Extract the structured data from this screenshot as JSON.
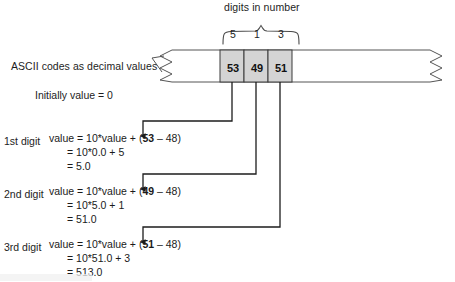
{
  "diagram": {
    "title_caption": "digits in number",
    "tape_label": "ASCII codes as decimal values",
    "initial_label": "Initially value = 0",
    "accent_color": "#d4d4d4",
    "line_color": "#222222",
    "digits": [
      "5",
      "1",
      "3"
    ],
    "cells": [
      {
        "ascii": "53",
        "digit": "5"
      },
      {
        "ascii": "49",
        "digit": "1"
      },
      {
        "ascii": "51",
        "digit": "3"
      }
    ],
    "steps": [
      {
        "name": "1st digit",
        "line1_pre": "value = 10*value + (",
        "line1_bold": "53",
        "line1_post": " – 48)",
        "line2": "= 10*0.0 + 5",
        "line3": "= 5.0"
      },
      {
        "name": "2nd digit",
        "line1_pre": "value = 10*value + (",
        "line1_bold": "49",
        "line1_post": " – 48)",
        "line2": "= 10*5.0 + 1",
        "line3": "= 51.0"
      },
      {
        "name": "3rd digit",
        "line1_pre": "value = 10*value + (",
        "line1_bold": "51",
        "line1_post": " – 48)",
        "line2": "= 10*51.0 + 3",
        "line3": "= 513.0"
      }
    ]
  }
}
